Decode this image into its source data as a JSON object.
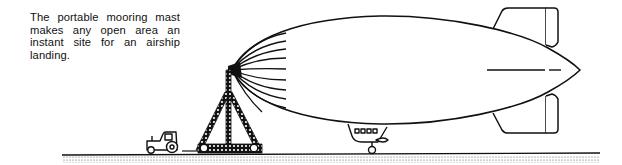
{
  "caption": {
    "text": "The portable mooring mast makes any open area an instant site for an airship landing."
  },
  "figure": {
    "subjects": [
      "airship",
      "portable-mooring-mast",
      "tractor",
      "gondola",
      "ground"
    ],
    "colors": {
      "ink": "#111111",
      "background": "#ffffff",
      "ground_stipple": "#555555"
    }
  }
}
